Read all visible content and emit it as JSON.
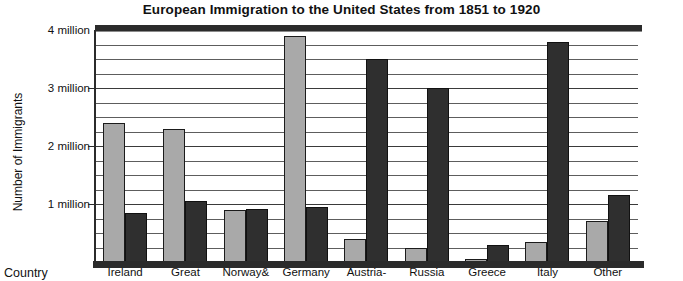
{
  "chart_data": {
    "type": "bar",
    "title": "European Immigration to the United States from 1851 to 1920",
    "xlabel": "Country",
    "ylabel": "Number of Immigrants",
    "categories": [
      "Ireland",
      "Great",
      "Norway&",
      "Germany",
      "Austria-",
      "Russia",
      "Greece",
      "Italy",
      "Other"
    ],
    "series": [
      {
        "name": "light",
        "values": [
          2.4,
          2.3,
          0.9,
          3.9,
          0.4,
          0.25,
          0.05,
          0.35,
          0.7
        ]
      },
      {
        "name": "dark",
        "values": [
          0.85,
          1.05,
          0.92,
          0.95,
          3.5,
          3.0,
          0.3,
          3.8,
          1.15
        ]
      }
    ],
    "ylim": [
      0,
      4
    ],
    "ytick_labels": [
      "1 million",
      "2 million",
      "3 million",
      "4 million"
    ],
    "ytick_values": [
      1,
      2,
      3,
      4
    ],
    "gridlines": true,
    "gridline_interval": 0.25,
    "legend": "none",
    "units": "millions of immigrants"
  },
  "colors": {
    "light_bar": "#a9a9a9",
    "dark_bar": "#2f2f2f",
    "axis": "#2b2b2b",
    "grid": "#5d5d5d",
    "background": "#ffffff",
    "text": "#111111"
  }
}
